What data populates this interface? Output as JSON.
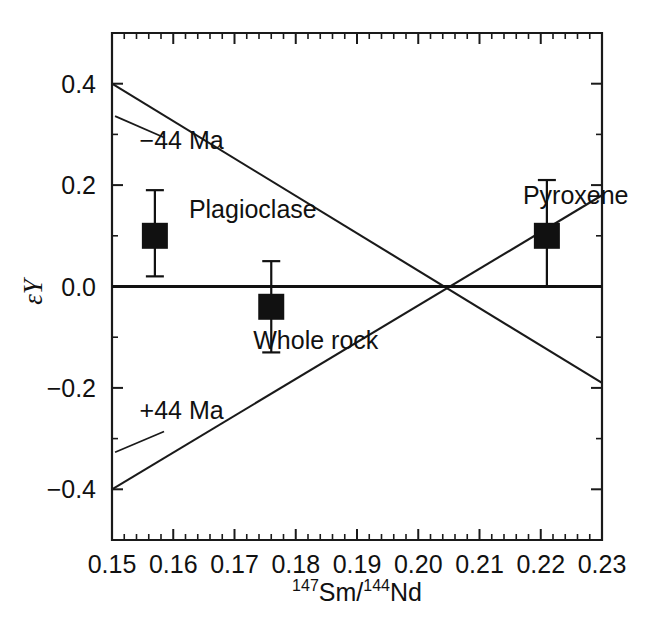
{
  "figure": {
    "background_color": "#ffffff",
    "ink_color": "#111111"
  },
  "chart_data": {
    "type": "scatter",
    "title": "",
    "subtitle": "",
    "xlabel_parts": {
      "sup1": "147",
      "mid1": "Sm/",
      "sup2": "144",
      "mid2": "Nd"
    },
    "xlabel": "147Sm/144Nd",
    "ylabel": "εY",
    "ylabel_epsilon": "ε",
    "ylabel_element": "Y",
    "xlim": [
      0.15,
      0.23
    ],
    "ylim": [
      -0.5,
      0.5
    ],
    "grid": false,
    "legend_position": "none",
    "x_major_ticks": [
      0.15,
      0.16,
      0.17,
      0.18,
      0.19,
      0.2,
      0.21,
      0.22,
      0.23
    ],
    "x_major_tick_labels": [
      "0.15",
      "0.16",
      "0.17",
      "0.18",
      "0.19",
      "0.20",
      "0.21",
      "0.22",
      "0.23"
    ],
    "x_minor_per_major": 5,
    "y_major_ticks": [
      -0.4,
      -0.2,
      0.0,
      0.2,
      0.4
    ],
    "y_major_tick_labels": [
      "−0.4",
      "−0.2",
      "0.0",
      "0.2",
      "0.4"
    ],
    "y_minor_per_major": 2,
    "points": [
      {
        "name": "Plagioclase",
        "label": "Plagioclase",
        "x": 0.157,
        "y": 0.1,
        "yerr_low": 0.08,
        "yerr_high": 0.09,
        "marker": "filled-square",
        "label_dx": 34,
        "label_dy": -18
      },
      {
        "name": "Whole rock",
        "label": "Whole rock",
        "x": 0.176,
        "y": -0.04,
        "yerr_low": 0.09,
        "yerr_high": 0.09,
        "marker": "filled-square",
        "label_dx": -18,
        "label_dy": 42
      },
      {
        "name": "Pyroxene",
        "label": "Pyroxene",
        "x": 0.221,
        "y": 0.1,
        "yerr_low": 0.1,
        "yerr_high": 0.11,
        "marker": "filled-square",
        "label_dx": -24,
        "label_dy": -32
      }
    ],
    "reference_line": {
      "name": "zero-reference",
      "y": 0.0,
      "x_from": 0.15,
      "x_to": 0.23
    },
    "isochrons": [
      {
        "name": "minus-44-Ma",
        "label": "−44 Ma",
        "x_from": 0.15,
        "y_from": 0.4,
        "x_to": 0.23,
        "y_to": -0.19,
        "label_x": 0.1545,
        "label_y": 0.272,
        "leader_from_x": 0.1505,
        "leader_from_y": 0.336,
        "leader_to_x": 0.1585,
        "leader_to_y": 0.294
      },
      {
        "name": "plus-44-Ma",
        "label": "+44 Ma",
        "x_from": 0.15,
        "y_from": -0.4,
        "x_to": 0.23,
        "y_to": 0.18,
        "label_x": 0.1545,
        "label_y": -0.262,
        "leader_from_x": 0.1505,
        "leader_from_y": -0.327,
        "leader_to_x": 0.1585,
        "leader_to_y": -0.286
      }
    ],
    "intersection": {
      "x": 0.199,
      "y": 0.0
    },
    "annotations": [
      "−44 Ma",
      "+44 Ma",
      "Plagioclase",
      "Whole rock",
      "Pyroxene"
    ]
  }
}
